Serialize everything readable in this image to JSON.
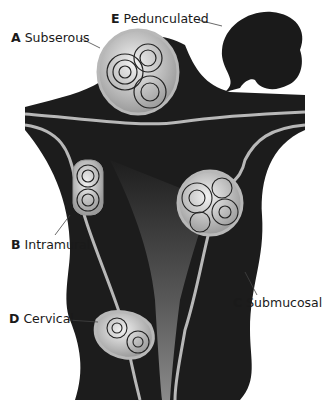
{
  "diagram": {
    "colors": {
      "background": "#ffffff",
      "tissue": "#1c1c1c",
      "lining": "#b8b8b8",
      "fibroid_fill": "#d9d9d9",
      "fibroid_rings": "#222222",
      "leader_line": "#444444",
      "label_text": "#1a1a1a"
    },
    "labels": [
      {
        "letter": "A",
        "text": "Subserous"
      },
      {
        "letter": "B",
        "text": "Intramural"
      },
      {
        "letter": "C",
        "text": "Submucosal"
      },
      {
        "letter": "D",
        "text": "Cervical"
      },
      {
        "letter": "E",
        "text": "Pedunculated"
      }
    ]
  }
}
